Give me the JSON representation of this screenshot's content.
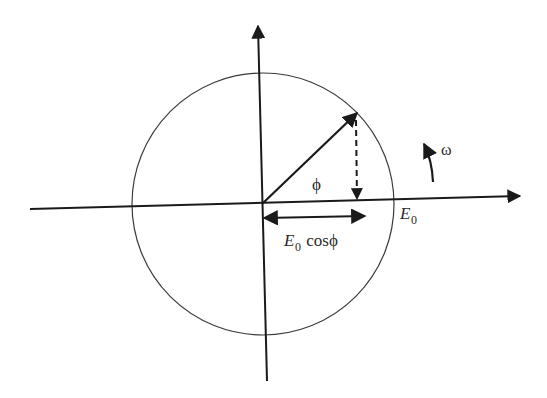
{
  "diagram": {
    "colors": {
      "stroke": "#1a1a1a",
      "circle": "#3a3a3a",
      "background": "#ffffff"
    },
    "labels": {
      "angle": "ϕ",
      "angular_velocity": "ω",
      "amplitude_main": "E",
      "amplitude_sub": "0",
      "projection_main": "E",
      "projection_sub": "0",
      "projection_func": " cosϕ"
    },
    "elements": {
      "horizontal_axis": "x-axis with arrow pointing right",
      "vertical_axis": "y-axis with arrow pointing up",
      "circle": "circle of radius E0 centered at origin",
      "phasor": "vector E0 at angle ϕ",
      "projection_dashed": "dashed drop line from phasor tip to x-axis",
      "projection_arrow": "double-headed arrow indicating E0 cosϕ",
      "rotation_arrow": "curved arrow indicating counter-clockwise rotation ω"
    }
  }
}
